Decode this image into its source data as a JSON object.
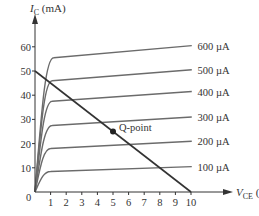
{
  "chart_data": {
    "type": "line",
    "title": "",
    "xlabel": "V_CE (V)",
    "ylabel": "I_C (mA)",
    "xlim": [
      0,
      10
    ],
    "ylim": [
      0,
      65
    ],
    "x_ticks": [
      1,
      2,
      3,
      4,
      5,
      6,
      7,
      8,
      9,
      10
    ],
    "y_ticks": [
      10,
      20,
      30,
      40,
      50,
      60
    ],
    "origin_label": "0",
    "grid": false,
    "legend": "inline labels at right end of curves",
    "series": [
      {
        "name": "100 µA",
        "label": "100 µA",
        "sat_current": 8.5,
        "end_current": 10.5,
        "knee_v": 1.0
      },
      {
        "name": "200 µA",
        "label": "200 µA",
        "sat_current": 18,
        "end_current": 21,
        "knee_v": 1.0
      },
      {
        "name": "300 µA",
        "label": "300 µA",
        "sat_current": 27.5,
        "end_current": 31,
        "knee_v": 1.1
      },
      {
        "name": "400 µA",
        "label": "400 µA",
        "sat_current": 37.5,
        "end_current": 41.5,
        "knee_v": 1.1
      },
      {
        "name": "500 µA",
        "label": "500 µA",
        "sat_current": 46,
        "end_current": 50.5,
        "knee_v": 1.1
      },
      {
        "name": "600 µA",
        "label": "600 µA",
        "sat_current": 55.5,
        "end_current": 60.5,
        "knee_v": 1.2
      }
    ],
    "load_line": {
      "x": [
        0,
        10
      ],
      "y": [
        50,
        0
      ]
    },
    "q_point": {
      "label": "Q-point",
      "x": 5,
      "y": 25
    }
  },
  "labels": {
    "y_axis_symbol": "I",
    "y_axis_sub": "C",
    "y_axis_unit": " (mA)",
    "x_axis_symbol": "V",
    "x_axis_sub": "CE",
    "x_axis_unit": " (V)"
  }
}
